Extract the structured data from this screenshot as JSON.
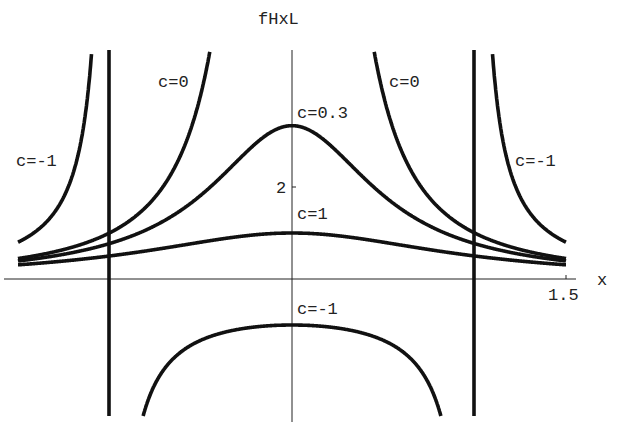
{
  "chart_data": {
    "type": "line",
    "title": "",
    "function": "f(x) = 1/(c + x^2)",
    "xlabel": "x",
    "ylabel": "fHxL",
    "xlim": [
      -1.5,
      1.5
    ],
    "ylim": [
      -2.1,
      5.0
    ],
    "x_ticks": [
      {
        "value": 1.5,
        "label": "1.5"
      }
    ],
    "y_ticks": [
      {
        "value": 2,
        "label": "2"
      }
    ],
    "grid": false,
    "legend": "none (inline curve labels)",
    "asymptotes": [
      {
        "x": -1,
        "series": "c=-1"
      },
      {
        "x": 1,
        "series": "c=-1"
      }
    ],
    "series": [
      {
        "name": "c=0.3",
        "c": 0.3,
        "label_pos": {
          "x": 0.05,
          "y": 3.75
        },
        "x": [
          -1.5,
          -1.0,
          -0.5,
          0,
          0.5,
          1.0,
          1.5
        ],
        "y": [
          0.39,
          0.77,
          1.82,
          3.33,
          1.82,
          0.77,
          0.39
        ]
      },
      {
        "name": "c=0",
        "c": 0,
        "label_pos": {
          "x": -0.95,
          "y": 4.4
        },
        "label_pos2": {
          "x": 0.56,
          "y": 4.4
        },
        "x": [
          -1.5,
          -1.0,
          -0.6,
          -0.45,
          0.45,
          0.6,
          1.0,
          1.5
        ],
        "y": [
          0.44,
          1.0,
          2.78,
          4.94,
          4.94,
          2.78,
          1.0,
          0.44
        ]
      },
      {
        "name": "c=1",
        "c": 1,
        "label_pos": {
          "x": 0.05,
          "y": 1.45
        },
        "x": [
          -1.5,
          -1.0,
          -0.5,
          0,
          0.5,
          1.0,
          1.5
        ],
        "y": [
          0.31,
          0.5,
          0.8,
          1.0,
          0.8,
          0.5,
          0.31
        ]
      },
      {
        "name": "c=-1",
        "c": -1,
        "label_pos": {
          "x": -1.45,
          "y": 2.8
        },
        "label_pos2": {
          "x": 1.2,
          "y": 2.8
        },
        "label_pos3": {
          "x": 0.05,
          "y": -0.45
        },
        "x": [
          -1.5,
          -1.25,
          -1.1,
          -0.95,
          -0.7,
          -0.35,
          0,
          0.35,
          0.7,
          0.95,
          1.1,
          1.25,
          1.5
        ],
        "y": [
          0.8,
          1.78,
          4.76,
          -10.26,
          -1.96,
          -1.14,
          -1.0,
          -1.14,
          -1.96,
          -10.26,
          4.76,
          1.78,
          0.8
        ]
      }
    ]
  },
  "labels": {
    "ylabel": "fHxL",
    "xlabel": "x",
    "xtick": "1.5",
    "ytick": "2",
    "c03": "c=0.3",
    "c0_left": "c=0",
    "c0_right": "c=0",
    "c1": "c=1",
    "cm1_left": "c=-1",
    "cm1_right": "c=-1",
    "cm1_bottom": "c=-1"
  }
}
